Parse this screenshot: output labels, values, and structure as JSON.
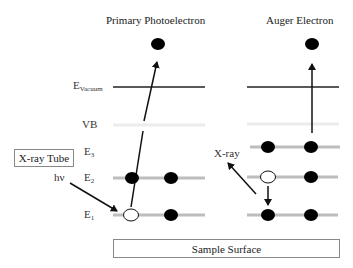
{
  "titles": {
    "left": "Primary Photoelectron",
    "right": "Auger Electron"
  },
  "levels": {
    "vacuum": {
      "main": "E",
      "sub": "Vacuum"
    },
    "vb": "VB",
    "e3": {
      "main": "E",
      "sub": "3"
    },
    "e2": {
      "main": "E",
      "sub": "2"
    },
    "e1": {
      "main": "E",
      "sub": "1"
    }
  },
  "labels": {
    "xray_tube": "X-ray Tube",
    "hv": "hν",
    "xray": "X-ray",
    "sample_surface": "Sample Surface"
  },
  "colors": {
    "level_line": "#bdbdbd",
    "vb_line": "#ececec",
    "vacuum_line": "#222222",
    "electron": "#000000",
    "hole": "#ffffff"
  }
}
